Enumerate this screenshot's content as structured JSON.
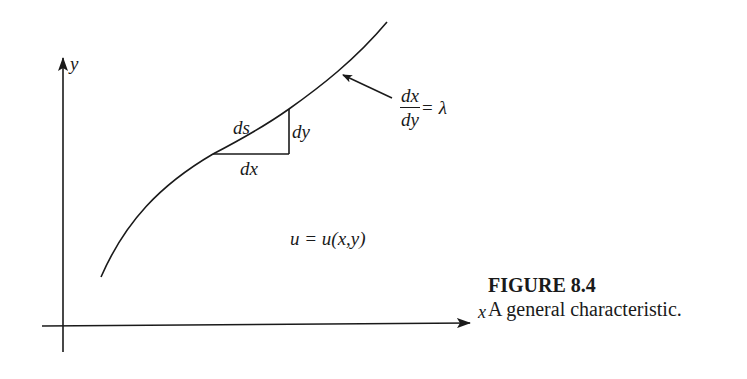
{
  "figure": {
    "number_label": "FIGURE 8.4",
    "description": "A general characteristic."
  },
  "axes": {
    "x_label": "x",
    "y_label": "y"
  },
  "curve": {
    "name": "characteristic curve"
  },
  "triangle": {
    "hypotenuse_label": "ds",
    "vertical_label": "dy",
    "horizontal_label": "dx"
  },
  "slope_annotation": {
    "numerator": "dx",
    "denominator": "dy",
    "equals": "=",
    "value": "λ"
  },
  "region_label": "u = u(x,y)",
  "colors": {
    "ink": "#1a1a1a",
    "background": "#ffffff"
  }
}
